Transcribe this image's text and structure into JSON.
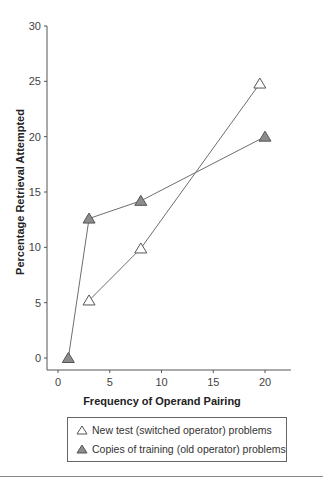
{
  "chart_data": {
    "type": "line",
    "title": "",
    "xlabel": "Frequency of Operand Pairing",
    "ylabel": "Percentage Retrieval Attempted",
    "xlim": [
      -1,
      23
    ],
    "ylim": [
      -1,
      30
    ],
    "xticks": [
      0,
      5,
      10,
      15,
      20
    ],
    "yticks": [
      0,
      5,
      10,
      15,
      20,
      25,
      30
    ],
    "grid": false,
    "legend_position": "bottom",
    "series": [
      {
        "name": "New test (switched operator) problems",
        "marker": "open-triangle",
        "color": "#ffffff",
        "x": [
          3,
          8,
          19.5
        ],
        "y": [
          5.2,
          9.9,
          24.8
        ]
      },
      {
        "name": "Copies of training (old operator) problems",
        "marker": "filled-triangle",
        "color": "#8c8c8c",
        "x": [
          1,
          3,
          8,
          20
        ],
        "y": [
          0,
          12.6,
          14.2,
          20
        ]
      }
    ]
  },
  "labels": {
    "xlabel": "Frequency of Operand Pairing",
    "ylabel": "Percentage Retrieval Attempted",
    "legend": [
      "New test (switched operator) problems",
      "Copies of training (old operator) problems"
    ]
  },
  "colors": {
    "line": "#6e6e6e",
    "axis": "#555555",
    "filled_marker": "#8c8c8c"
  }
}
